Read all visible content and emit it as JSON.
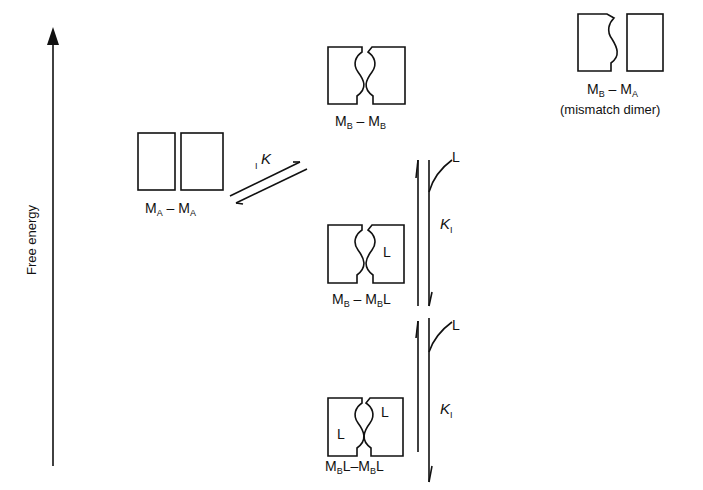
{
  "axis": {
    "label": "Free energy",
    "direction": "up"
  },
  "species": {
    "ma_ma": {
      "m1": "M",
      "s1": "A",
      "sep": " – ",
      "m2": "M",
      "s2": "A",
      "shape": "two flat rectangles"
    },
    "mb_mb": {
      "m1": "M",
      "s1": "B",
      "sep": " – ",
      "m2": "M",
      "s2": "B",
      "shape": "two rectangles with complementary wavy faces"
    },
    "mb_ma": {
      "m1": "M",
      "s1": "B",
      "sep": " – ",
      "m2": "M",
      "s2": "A",
      "note": "(mismatch dimer)"
    },
    "mb_mbl": {
      "m1": "M",
      "s1": "B",
      "sep": " – ",
      "m2": "M",
      "s2": "B",
      "lig2": "L",
      "box_ligand": "L"
    },
    "mbl_mbl": {
      "m1": "M",
      "s1": "B",
      "lig1": "L",
      "sep": "–",
      "m2": "M",
      "s2": "B",
      "lig2": "L",
      "box_ligand_left": "L",
      "box_ligand_right": "L"
    }
  },
  "equilibria": {
    "conformational": {
      "prefix": "I",
      "symbol": "K"
    },
    "binding_1": {
      "symbol": "K",
      "subscript": "I",
      "ligand": "L"
    },
    "binding_2": {
      "symbol": "K",
      "subscript": "I",
      "ligand": "L"
    }
  },
  "colors": {
    "line": "#111111",
    "background": "#ffffff"
  }
}
